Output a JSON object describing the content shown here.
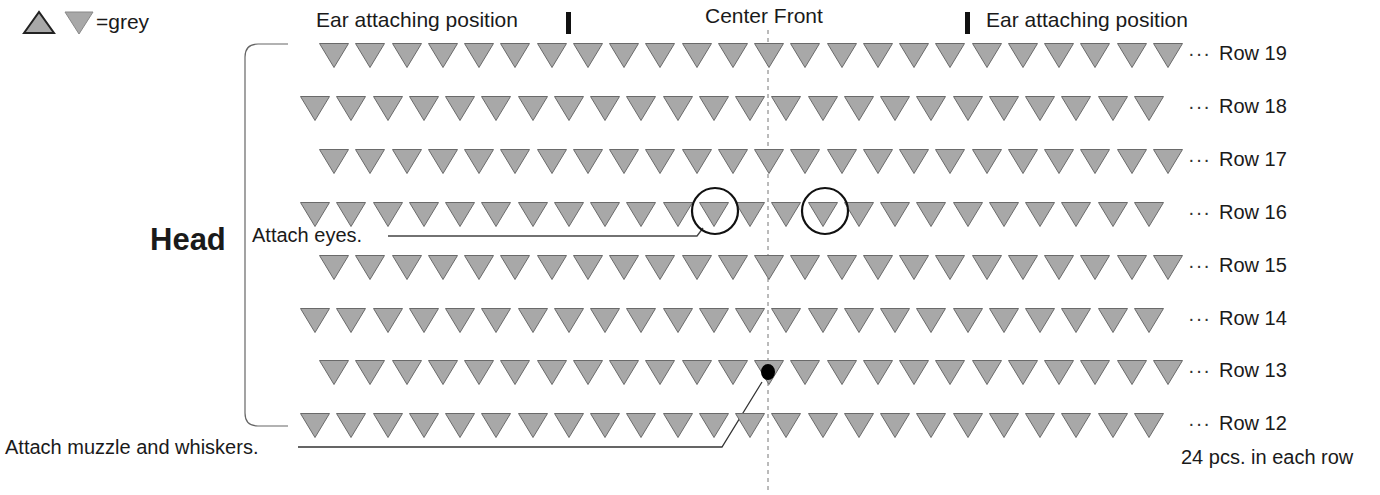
{
  "legend": {
    "icons": [
      "triangle-up-icon",
      "triangle-down-icon"
    ],
    "text": "=grey",
    "color": "#a8a8a8"
  },
  "header": {
    "ear_left": "Ear attaching position",
    "center": "Center Front",
    "ear_right": "Ear attaching position"
  },
  "section_label": "Head",
  "rows": [
    {
      "label": "Row 19",
      "count": 24,
      "offset": "odd"
    },
    {
      "label": "Row 18",
      "count": 24,
      "offset": "even"
    },
    {
      "label": "Row 17",
      "count": 24,
      "offset": "odd"
    },
    {
      "label": "Row 16",
      "count": 24,
      "offset": "even"
    },
    {
      "label": "Row 15",
      "count": 24,
      "offset": "odd"
    },
    {
      "label": "Row 14",
      "count": 24,
      "offset": "even"
    },
    {
      "label": "Row 13",
      "count": 24,
      "offset": "odd"
    },
    {
      "label": "Row 12",
      "count": 24,
      "offset": "even"
    }
  ],
  "row_dots": "···",
  "annotations": {
    "eyes": "Attach eyes.",
    "muzzle": "Attach muzzle and whiskers.",
    "count_note": "24 pcs. in each row"
  },
  "colors": {
    "triangle_fill": "#a8a8a8",
    "triangle_stroke": "#6a6a6a",
    "line": "#333333"
  }
}
